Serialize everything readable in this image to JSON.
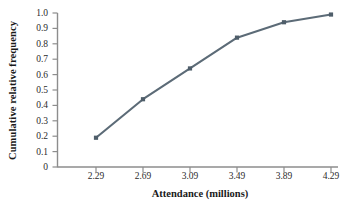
{
  "chart_data": {
    "type": "line",
    "title": "",
    "subtitle": "",
    "xlabel": "Attendance (millions)",
    "ylabel": "Cumulative relative frequency",
    "x": [
      2.29,
      2.69,
      3.09,
      3.49,
      3.89,
      4.29
    ],
    "xtick_labels": [
      "2.29",
      "2.69",
      "3.09",
      "3.49",
      "3.89",
      "4.29"
    ],
    "values": [
      0.19,
      0.44,
      0.64,
      0.84,
      0.94,
      0.99
    ],
    "ytick_labels": [
      "1.0",
      "0.9",
      "0.8",
      "0.7",
      "0.6",
      "0.5",
      "0.4",
      "0.3",
      "0.2",
      "0.1",
      "0"
    ],
    "ytick_values": [
      1.0,
      0.9,
      0.8,
      0.7,
      0.6,
      0.5,
      0.4,
      0.3,
      0.2,
      0.1,
      0
    ],
    "ylim": [
      0,
      1.0
    ],
    "grid": false,
    "legend": null,
    "legend_position": "none",
    "series": [
      {
        "name": "Cumulative relative frequency",
        "values": [
          0.19,
          0.44,
          0.64,
          0.84,
          0.94,
          0.99
        ],
        "marker": "square",
        "color": "#5c6b77"
      }
    ],
    "annotations": [],
    "colors": {
      "line": "#5c6b77",
      "marker": "#4f5e6a",
      "axis": "#8b8b8b",
      "text": "#1a1a1a",
      "background": "#ffffff"
    }
  }
}
